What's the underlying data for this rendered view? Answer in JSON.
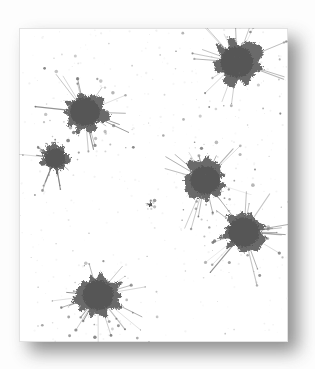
{
  "artwork": {
    "title": "Ink Blot Spatter Card",
    "medium": "ink spatter on paper",
    "background_color": "#fdfdfd",
    "card": {
      "x": 19,
      "y": 28,
      "width": 269,
      "height": 314,
      "fill_color": "#ffffff",
      "border_color": "#e2e2e2",
      "speckle_color": "#ebebeb"
    },
    "shadow": {
      "color": "#4a4a4a",
      "offset_x": 10,
      "offset_y": 10,
      "blur": 9,
      "opacity": 0.62
    },
    "ink": {
      "core_color": "#565656",
      "mid_color": "#5e5e5e",
      "edge_color": "#6b6b6b",
      "spatter_color": "#707070",
      "count": 7
    },
    "blots": [
      {
        "id": "blot-top-right",
        "label": "Top right blot",
        "cx": 237,
        "cy": 62,
        "radius": 22,
        "seed": 11,
        "rays": 16,
        "droplets": 22
      },
      {
        "id": "blot-upper-left",
        "label": "Upper left blot",
        "cx": 85,
        "cy": 112,
        "radius": 20,
        "seed": 23,
        "rays": 15,
        "droplets": 20
      },
      {
        "id": "blot-left-small",
        "label": "Small left blot",
        "cx": 55,
        "cy": 158,
        "radius": 14,
        "seed": 37,
        "rays": 11,
        "droplets": 14
      },
      {
        "id": "blot-center",
        "label": "Center blot",
        "cx": 205,
        "cy": 180,
        "radius": 20,
        "seed": 51,
        "rays": 17,
        "droplets": 22
      },
      {
        "id": "blot-right-lower",
        "label": "Lower right blot",
        "cx": 244,
        "cy": 232,
        "radius": 21,
        "seed": 67,
        "rays": 18,
        "droplets": 24
      },
      {
        "id": "blot-bottom",
        "label": "Bottom blot",
        "cx": 98,
        "cy": 295,
        "radius": 21,
        "seed": 83,
        "rays": 19,
        "droplets": 26
      },
      {
        "id": "blot-micro-upper",
        "label": "Micro speck cluster",
        "cx": 150,
        "cy": 205,
        "radius": 2,
        "seed": 97,
        "rays": 4,
        "droplets": 6
      }
    ]
  }
}
